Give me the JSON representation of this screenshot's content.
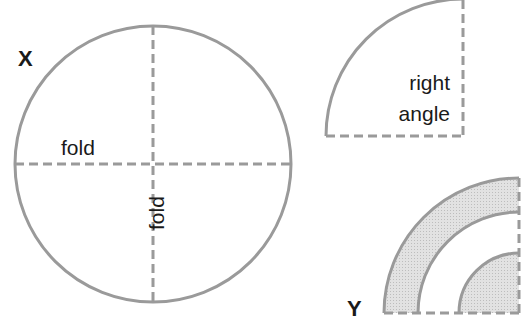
{
  "diagram": {
    "colors": {
      "stroke": "#9a9a9a",
      "fill": "#d9d9d9",
      "text": "#1a1a1a",
      "background": "#ffffff"
    },
    "figure_x": {
      "label": "X",
      "shape": "circle",
      "fold_labels": {
        "horizontal": "fold",
        "vertical": "fold"
      }
    },
    "figure_quarter": {
      "shape": "quarter circle",
      "label_line1": "right",
      "label_line2": "angle"
    },
    "figure_y": {
      "label": "Y",
      "shape": "nested quarter circles with shaded rings"
    }
  }
}
